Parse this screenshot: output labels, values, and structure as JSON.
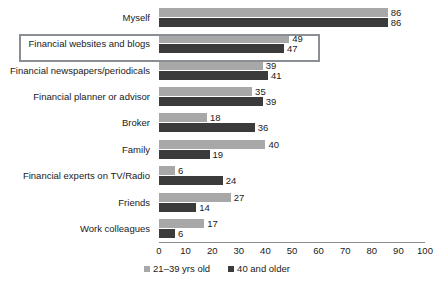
{
  "chart_data": {
    "type": "bar",
    "orientation": "horizontal",
    "title": "",
    "xlabel": "",
    "ylabel": "",
    "xlim": [
      0,
      100
    ],
    "xticks": [
      0,
      10,
      20,
      30,
      40,
      50,
      60,
      70,
      80,
      90,
      100
    ],
    "grid": false,
    "legend_position": "bottom",
    "categories": [
      "Myself",
      "Financial websites and blogs",
      "Financial newspapers/periodicals",
      "Financial planner or advisor",
      "Broker",
      "Family",
      "Financial experts on TV/Radio",
      "Friends",
      "Work colleagues"
    ],
    "series": [
      {
        "name": "21–39 yrs old",
        "color": "#a8a8a8",
        "values": [
          86,
          49,
          39,
          35,
          18,
          40,
          6,
          27,
          17
        ]
      },
      {
        "name": "40 and older",
        "color": "#3b3b3b",
        "values": [
          86,
          47,
          41,
          39,
          36,
          19,
          24,
          14,
          6
        ]
      }
    ]
  },
  "legend": {
    "entries": [
      {
        "label": "21–39 yrs old",
        "swatch": "young"
      },
      {
        "label": "40 and older",
        "swatch": "older"
      }
    ]
  },
  "annotations": {
    "highlight": {
      "target_category": "Financial websites and blogs",
      "border_color": "#8a8f96"
    }
  },
  "colors": {
    "series_young": "#a8a8a8",
    "series_older": "#3b3b3b",
    "axis": "#8e8e8e",
    "text": "#1a1a1a",
    "background": "#ffffff",
    "highlight_border": "#8a8f96"
  }
}
